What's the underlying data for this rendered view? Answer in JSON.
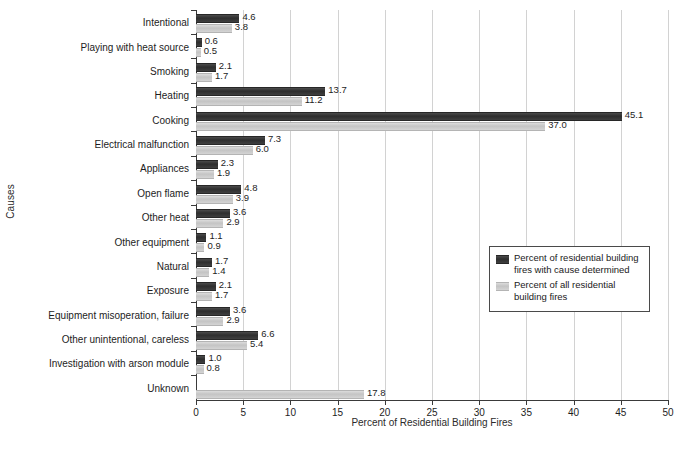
{
  "chart_data": {
    "type": "bar",
    "orientation": "horizontal",
    "title": "",
    "xlabel": "Percent of Residential Building Fires",
    "ylabel": "Causes",
    "xlim": [
      0,
      50
    ],
    "xticks": [
      0,
      5,
      10,
      15,
      20,
      25,
      30,
      35,
      40,
      45,
      50
    ],
    "grid": "vertical",
    "legend_position": "center-right",
    "categories": [
      "Intentional",
      "Playing with heat source",
      "Smoking",
      "Heating",
      "Cooking",
      "Electrical malfunction",
      "Appliances",
      "Open flame",
      "Other heat",
      "Other equipment",
      "Natural",
      "Exposure",
      "Equipment misoperation, failure",
      "Other unintentional, careless",
      "Investigation with arson module",
      "Unknown"
    ],
    "series": [
      {
        "name": "Percent of residential building fires with cause determined",
        "color": "#333333",
        "values": [
          4.6,
          0.6,
          2.1,
          13.7,
          45.1,
          7.3,
          2.3,
          4.8,
          3.6,
          1.1,
          1.7,
          2.1,
          3.6,
          6.6,
          1.0,
          null
        ],
        "labels": [
          "4.6",
          "0.6",
          "2.1",
          "13.7",
          "45.1",
          "7.3",
          "2.3",
          "4.8",
          "3.6",
          "1.1",
          "1.7",
          "2.1",
          "3.6",
          "6.6",
          "1.0",
          ""
        ]
      },
      {
        "name": "Percent of all residential building fires",
        "color": "#c8c8c8",
        "values": [
          3.8,
          0.5,
          1.7,
          11.2,
          37.0,
          6.0,
          1.9,
          3.9,
          2.9,
          0.9,
          1.4,
          1.7,
          2.9,
          5.4,
          0.8,
          17.8
        ],
        "labels": [
          "3.8",
          "0.5",
          "1.7",
          "11.2",
          "37.0",
          "6.0",
          "1.9",
          "3.9",
          "2.9",
          "0.9",
          "1.4",
          "1.7",
          "2.9",
          "5.4",
          "0.8",
          "17.8"
        ]
      }
    ]
  },
  "axes": {
    "x_title": "Percent of Residential Building Fires",
    "y_title": "Causes",
    "x_tick_labels": [
      "0",
      "5",
      "10",
      "15",
      "20",
      "25",
      "30",
      "35",
      "40",
      "45",
      "50"
    ]
  },
  "legend": {
    "items": [
      {
        "label": "Percent of residential building fires with cause determined",
        "swatch": "determined"
      },
      {
        "label": "Percent of all residential building fires",
        "swatch": "all"
      }
    ]
  }
}
